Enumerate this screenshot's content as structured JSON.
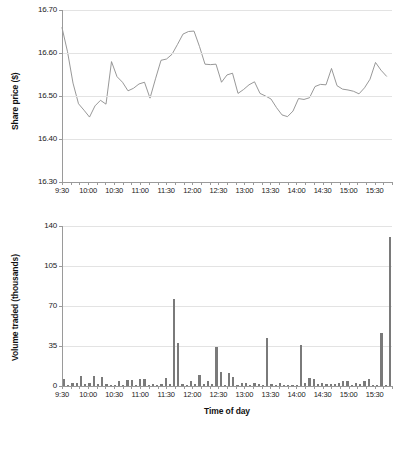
{
  "figure": {
    "background": "#ffffff",
    "line_color": "#8c8c8c",
    "bar_color": "#7a7a7a",
    "grid_color": "#e3e3e3",
    "axis_color": "#9a9a9a"
  },
  "chart_data": [
    {
      "type": "line",
      "title": "",
      "xlabel": "",
      "ylabel": "Share price ($)",
      "ylim": [
        16.3,
        16.7
      ],
      "yticks": [
        16.3,
        16.4,
        16.5,
        16.6,
        16.7
      ],
      "ytick_labels": [
        "16.30",
        "16.40",
        "16.50",
        "16.60",
        "16.70"
      ],
      "grid": true,
      "legend": null,
      "xtick_labels": [
        "9:30",
        "10:00",
        "10:30",
        "11:00",
        "11:30",
        "12:00",
        "12:30",
        "13:00",
        "13:30",
        "14:00",
        "14:30",
        "15:00",
        "15:30"
      ],
      "x": [
        "9:30",
        "9:40",
        "9:50",
        "10:00",
        "10:10",
        "10:20",
        "10:30",
        "10:40",
        "10:50",
        "11:00",
        "11:10",
        "11:20",
        "11:30",
        "11:40",
        "11:50",
        "12:00",
        "12:10",
        "12:20",
        "12:30",
        "12:40",
        "12:50",
        "13:00",
        "13:10",
        "13:20",
        "13:30",
        "13:40",
        "13:50",
        "14:00",
        "14:10",
        "14:20",
        "14:30",
        "14:40",
        "14:50",
        "15:00",
        "15:10",
        "15:20",
        "15:30",
        "15:40",
        "15:50"
      ],
      "values": [
        16.659,
        16.603,
        16.53,
        16.482,
        16.467,
        16.451,
        16.477,
        16.49,
        16.481,
        16.58,
        16.545,
        16.532,
        16.512,
        16.518,
        16.528,
        16.532,
        16.495,
        16.54,
        16.583,
        16.586,
        16.597,
        16.62,
        16.644,
        16.65,
        16.651,
        16.615,
        16.574,
        16.573,
        16.574,
        16.532,
        16.549,
        16.553,
        16.506,
        16.515,
        16.526,
        16.533,
        16.506,
        16.5,
        16.493,
        16.473,
        16.456,
        16.452,
        16.465,
        16.494,
        16.492,
        16.496,
        16.522,
        16.527,
        16.526,
        16.564,
        16.524,
        16.516,
        16.514,
        16.511,
        16.505,
        16.519,
        16.539,
        16.578,
        16.56,
        16.546
      ]
    },
    {
      "type": "bar",
      "title": "",
      "xlabel": "Time of day",
      "ylabel": "Volume traded (thousands)",
      "ylim": [
        0,
        140
      ],
      "yticks": [
        0,
        35,
        70,
        105,
        140
      ],
      "ytick_labels": [
        "0",
        "35",
        "70",
        "105",
        "140"
      ],
      "grid": true,
      "legend": null,
      "xtick_labels": [
        "9:30",
        "10:00",
        "10:30",
        "11:00",
        "11:30",
        "12:00",
        "12:30",
        "13:00",
        "13:30",
        "14:00",
        "14:30",
        "15:00",
        "15:30"
      ],
      "categories": [
        "9:30",
        "9:35",
        "9:40",
        "9:45",
        "9:50",
        "9:55",
        "10:00",
        "10:05",
        "10:10",
        "10:15",
        "10:20",
        "10:25",
        "10:30",
        "10:35",
        "10:40",
        "10:45",
        "10:50",
        "10:55",
        "11:00",
        "11:05",
        "11:10",
        "11:15",
        "11:20",
        "11:25",
        "11:30",
        "11:35",
        "11:40",
        "11:45",
        "11:50",
        "11:55",
        "12:00",
        "12:05",
        "12:10",
        "12:15",
        "12:20",
        "12:25",
        "12:30",
        "12:35",
        "12:40",
        "12:45",
        "12:50",
        "12:55",
        "13:00",
        "13:05",
        "13:10",
        "13:15",
        "13:20",
        "13:25",
        "13:30",
        "13:35",
        "13:40",
        "13:45",
        "13:50",
        "13:55",
        "14:00",
        "14:05",
        "14:10",
        "14:15",
        "14:20",
        "14:25",
        "14:30",
        "14:35",
        "14:40",
        "14:45",
        "14:50",
        "14:55",
        "15:00",
        "15:05",
        "15:10",
        "15:15",
        "15:20",
        "15:25",
        "15:30",
        "15:35",
        "15:40",
        "15:45",
        "15:50",
        "15:55"
      ],
      "values": [
        6,
        1,
        3,
        3,
        9,
        2,
        3,
        9,
        2,
        8,
        2,
        1,
        1,
        4,
        1,
        5,
        5,
        1,
        6,
        6,
        1,
        2,
        1,
        2,
        7,
        2,
        76,
        38,
        2,
        1,
        4,
        2,
        10,
        2,
        4,
        2,
        34,
        12,
        1,
        11,
        8,
        1,
        3,
        3,
        1,
        3,
        2,
        1,
        42,
        2,
        1,
        3,
        1,
        1,
        1,
        1,
        36,
        3,
        7,
        6,
        2,
        3,
        2,
        2,
        2,
        3,
        4,
        4,
        1,
        3,
        2,
        4,
        6,
        1,
        1,
        46,
        1,
        130
      ]
    }
  ]
}
